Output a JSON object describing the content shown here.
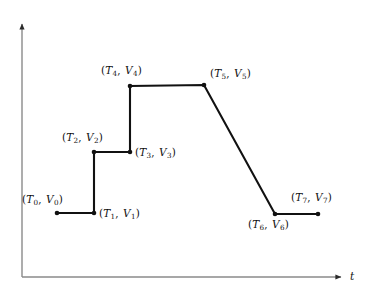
{
  "chart_data": {
    "type": "line",
    "title": "",
    "subtitle": "",
    "xlabel": "t",
    "ylabel": "",
    "grid": false,
    "legend": null,
    "axis_style": {
      "x_arrow": true,
      "y_arrow": true,
      "axis_color": "#8a8a8a",
      "line_color": "#111111",
      "marker_color": "#111111"
    },
    "xlim": [
      0,
      373
    ],
    "ylim": [
      295,
      0
    ],
    "points": [
      {
        "index": 0,
        "label": "(T0, V0)",
        "tex": "(T_0, V_0)",
        "x": 57,
        "y": 213,
        "label_x": 22,
        "label_y": 194,
        "label_anchor": "above-left"
      },
      {
        "index": 1,
        "label": "(T1, V1)",
        "tex": "(T_1, V_1)",
        "x": 94,
        "y": 213,
        "label_x": 99,
        "label_y": 208,
        "label_anchor": "right"
      },
      {
        "index": 2,
        "label": "(T2, V2)",
        "tex": "(T_2, V_2)",
        "x": 94,
        "y": 152,
        "label_x": 62,
        "label_y": 132,
        "label_anchor": "above-left"
      },
      {
        "index": 3,
        "label": "(T3, V3)",
        "tex": "(T_3, V_3)",
        "x": 130,
        "y": 152,
        "label_x": 135,
        "label_y": 147,
        "label_anchor": "right"
      },
      {
        "index": 4,
        "label": "(T4, V4)",
        "tex": "(T_4, V_4)",
        "x": 130,
        "y": 86,
        "label_x": 101,
        "label_y": 65,
        "label_anchor": "above-left"
      },
      {
        "index": 5,
        "label": "(T5, V5)",
        "tex": "(T_5, V_5)",
        "x": 204,
        "y": 85,
        "label_x": 210,
        "label_y": 68,
        "label_anchor": "above-right"
      },
      {
        "index": 6,
        "label": "(T6, V6)",
        "tex": "(T_6, V_6)",
        "x": 275,
        "y": 214,
        "label_x": 248,
        "label_y": 219,
        "label_anchor": "below-left"
      },
      {
        "index": 7,
        "label": "(T7, V7)",
        "tex": "(T_7, V_7)",
        "x": 318,
        "y": 214,
        "label_x": 291,
        "label_y": 192,
        "label_anchor": "above-right"
      }
    ],
    "series": [
      {
        "name": "v(t)",
        "x": [
          57,
          94,
          94,
          130,
          130,
          204,
          275,
          318
        ],
        "y": [
          213,
          213,
          152,
          152,
          86,
          85,
          214,
          214
        ]
      }
    ],
    "axes_geometry": {
      "origin_x": 22,
      "origin_y": 277,
      "y_top": 20,
      "x_right": 345,
      "x_label_x": 350,
      "x_label_y": 271
    }
  },
  "labels": {
    "p0": {
      "t": "T",
      "ts": "0",
      "v": "V",
      "vs": "0"
    },
    "p1": {
      "t": "T",
      "ts": "1",
      "v": "V",
      "vs": "1"
    },
    "p2": {
      "t": "T",
      "ts": "2",
      "v": "V",
      "vs": "2"
    },
    "p3": {
      "t": "T",
      "ts": "3",
      "v": "V",
      "vs": "3"
    },
    "p4": {
      "t": "T",
      "ts": "4",
      "v": "V",
      "vs": "4"
    },
    "p5": {
      "t": "T",
      "ts": "5",
      "v": "V",
      "vs": "5"
    },
    "p6": {
      "t": "T",
      "ts": "6",
      "v": "V",
      "vs": "6"
    },
    "p7": {
      "t": "T",
      "ts": "7",
      "v": "V",
      "vs": "7"
    },
    "open_paren": "(",
    "close_paren": ")",
    "comma": ",",
    "x_axis": "t"
  }
}
